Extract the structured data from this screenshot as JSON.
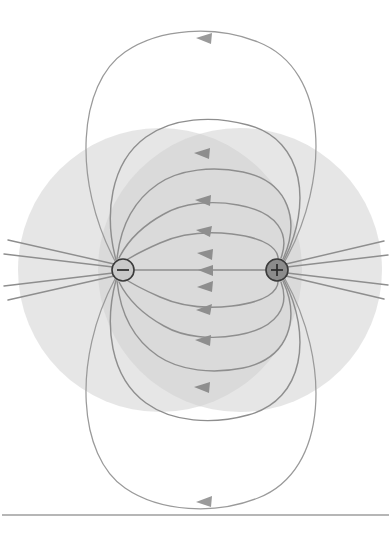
{
  "figure": {
    "title": "Electric field lines of an electric dipole",
    "type": "physics-field-line-diagram",
    "background_color": "#ffffff",
    "width": 391,
    "height": 533
  },
  "charges": [
    {
      "id": "negative-charge",
      "sign": "−",
      "label": "negative point charge",
      "cx": 123,
      "cy": 270,
      "r": 11,
      "fill": "#c9c9c9",
      "outline": "#3a3a3a"
    },
    {
      "id": "positive-charge",
      "sign": "+",
      "label": "positive point charge",
      "cx": 277,
      "cy": 270,
      "r": 11,
      "fill": "#8c8c8c",
      "outline": "#3a3a3a"
    }
  ],
  "shaded_regions": [
    {
      "id": "shade-left",
      "label": "left equipotential shading circle",
      "cx": 160,
      "cy": 270,
      "r": 142,
      "fill": "#cfcfcf",
      "opacity": 0.52
    },
    {
      "id": "shade-right",
      "label": "right equipotential shading circle",
      "cx": 240,
      "cy": 270,
      "r": 142,
      "fill": "#cfcfcf",
      "opacity": 0.52
    }
  ],
  "field_lines": {
    "stroke_color": "#8e8e8e",
    "stroke_width": 1.45,
    "arrow_direction": "from positive charge to negative charge (arrowheads point left)",
    "count_total": 16,
    "axis_line_note": "central horizontal line connects the two charges directly"
  },
  "baseline_rule": {
    "id": "page-rule",
    "label": "horizontal page rule",
    "y": 515,
    "x_start": 2,
    "x_end": 389,
    "color": "#6f6f6f"
  },
  "chart_data": {
    "type": "scatter",
    "title": "Electric field lines of an electric dipole",
    "xlabel": "",
    "ylabel": "",
    "xlim": [
      0,
      391
    ],
    "ylim": [
      533,
      0
    ],
    "grid": false,
    "legend": "none",
    "annotations": [
      "−",
      "+"
    ],
    "series": [
      {
        "name": "negative charge",
        "x": [
          123
        ],
        "y": [
          270
        ]
      },
      {
        "name": "positive charge",
        "x": [
          277
        ],
        "y": [
          270
        ]
      }
    ]
  }
}
